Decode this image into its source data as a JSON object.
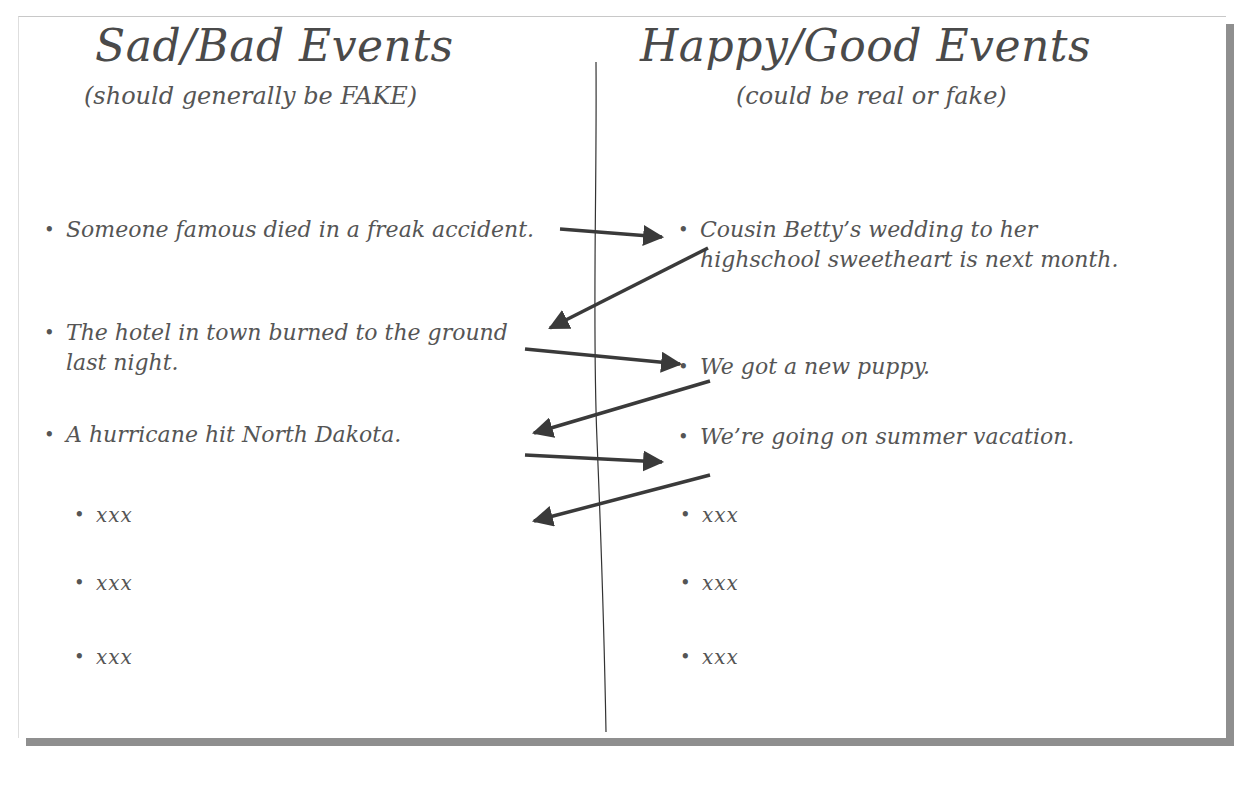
{
  "left_column": {
    "title": "Sad/Bad Events",
    "subtitle": "(should generally be FAKE)",
    "items": [
      "Someone famous died in a freak accident.",
      "The hotel in town burned to the ground last night.",
      "A hurricane hit North Dakota.",
      "xxx",
      "xxx",
      "xxx"
    ]
  },
  "right_column": {
    "title": "Happy/Good Events",
    "subtitle": "(could be real or fake)",
    "items": [
      "Cousin Betty’s wedding to her highschool sweetheart is next month.",
      "We got a new puppy.",
      "We’re going on summer vacation.",
      "xxx",
      "xxx",
      "xxx"
    ]
  },
  "bullet_glyph": "•",
  "colors": {
    "text": "#555555",
    "arrow": "#3a3a3a",
    "shadow": "#8f8f8f"
  }
}
